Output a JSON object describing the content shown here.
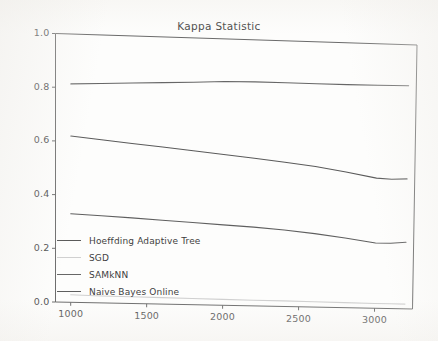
{
  "chart_data": {
    "type": "line",
    "title": "Kappa Statistic",
    "xlabel": "",
    "ylabel": "",
    "xlim": [
      900,
      3250
    ],
    "ylim": [
      0.0,
      1.0
    ],
    "grid": false,
    "legend_position": "lower left",
    "xticks": [
      1000,
      1500,
      2000,
      2500,
      3000
    ],
    "xtick_labels": [
      "1000",
      "1500",
      "2000",
      "2500",
      "3000"
    ],
    "yticks": [
      0.0,
      0.2,
      0.4,
      0.6,
      0.8,
      1.0
    ],
    "ytick_labels": [
      "0.0",
      "0.2",
      "0.4",
      "0.6",
      "0.8",
      "1.0"
    ],
    "x": [
      1000,
      1200,
      1400,
      1600,
      1800,
      2000,
      2200,
      2400,
      2600,
      2800,
      3000,
      3100,
      3200
    ],
    "series": [
      {
        "name": "Hoeffding Adaptive Tree",
        "color": "#5a5a5a",
        "values": [
          0.62,
          0.609,
          0.598,
          0.588,
          0.577,
          0.566,
          0.555,
          0.543,
          0.53,
          0.512,
          0.492,
          0.489,
          0.492
        ]
      },
      {
        "name": "SGD",
        "color": "#d0d0d0",
        "values": [
          0.028,
          0.026,
          0.025,
          0.024,
          0.023,
          0.022,
          0.021,
          0.021,
          0.02,
          0.019,
          0.018,
          0.018,
          0.018
        ]
      },
      {
        "name": "SAMkNN",
        "color": "#676767",
        "values": [
          0.814,
          0.819,
          0.824,
          0.829,
          0.834,
          0.84,
          0.842,
          0.842,
          0.842,
          0.842,
          0.843,
          0.844,
          0.845
        ]
      },
      {
        "name": "Naive Bayes Online",
        "color": "#5f5f5f",
        "values": [
          0.33,
          0.325,
          0.32,
          0.314,
          0.308,
          0.302,
          0.296,
          0.288,
          0.277,
          0.263,
          0.247,
          0.247,
          0.252
        ]
      }
    ]
  },
  "axes": {
    "frame_color": "#6b6b6b"
  },
  "legend": {
    "entries": [
      {
        "label": "Hoeffding Adaptive Tree"
      },
      {
        "label": "SGD"
      },
      {
        "label": "SAMkNN"
      },
      {
        "label": "Naive Bayes Online"
      }
    ]
  }
}
